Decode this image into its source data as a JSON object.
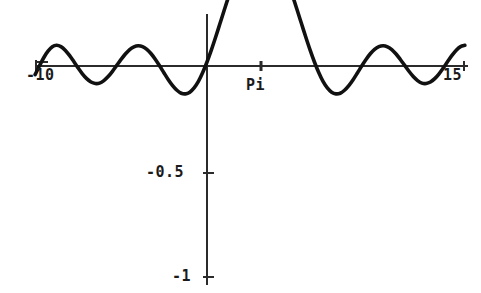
{
  "figure": {
    "width": 481,
    "height": 293,
    "background_color": "#ffffff",
    "curve_color": "#111111",
    "axis_color": "#2b2b2b"
  },
  "labels": {
    "x_min": "-10",
    "x_max": "15",
    "x_pi": "Pi",
    "y_half": "-0.5",
    "y_one": "-1"
  },
  "chart_data": {
    "type": "line",
    "title": "",
    "xlabel": "",
    "ylabel": "",
    "xlim": [
      -10,
      15
    ],
    "ylim": [
      -1,
      0.3
    ],
    "grid": false,
    "legend": null,
    "axes": {
      "x_axis_y_value": 0,
      "y_axis_x_value": 0,
      "x_ticks": [
        -10,
        3.14159,
        15
      ],
      "x_tick_labels": [
        "-10",
        "Pi",
        "15"
      ],
      "y_ticks": [
        -0.5,
        -1
      ],
      "y_tick_labels": [
        "-0.5",
        "-1"
      ]
    },
    "annotations": [
      {
        "text": "Pi",
        "x": 3.14159,
        "y": 0,
        "note": "marked tick at x = Pi where the curve attains its minimum"
      }
    ],
    "series": [
      {
        "name": "sin(x)/(x - Pi)",
        "description": "damped oscillation, negative sinc centred at x = Pi, minimum value -1 at x = Pi",
        "x": [
          -10.0,
          -9.75,
          -9.5,
          -9.25,
          -9.0,
          -8.75,
          -8.5,
          -8.25,
          -8.0,
          -7.75,
          -7.5,
          -7.25,
          -7.0,
          -6.75,
          -6.5,
          -6.25,
          -6.0,
          -5.75,
          -5.5,
          -5.25,
          -5.0,
          -4.75,
          -4.5,
          -4.25,
          -4.0,
          -3.75,
          -3.5,
          -3.25,
          -3.0,
          -2.75,
          -2.5,
          -2.25,
          -2.0,
          -1.75,
          -1.5,
          -1.25,
          -1.0,
          -0.75,
          -0.5,
          -0.25,
          0.0,
          0.25,
          0.5,
          0.75,
          1.0,
          1.25,
          1.5,
          1.75,
          2.0,
          2.25,
          2.5,
          2.75,
          3.0,
          3.14159,
          3.25,
          3.5,
          3.75,
          4.0,
          4.25,
          4.5,
          4.75,
          5.0,
          5.25,
          5.5,
          5.75,
          6.0,
          6.25,
          6.5,
          6.75,
          7.0,
          7.25,
          7.5,
          7.75,
          8.0,
          8.25,
          8.5,
          8.75,
          9.0,
          9.25,
          9.5,
          9.75,
          10.0,
          10.25,
          10.5,
          10.75,
          11.0,
          11.25,
          11.5,
          11.75,
          12.0,
          12.25,
          12.5,
          12.75,
          13.0,
          13.25,
          13.5,
          13.75,
          14.0,
          14.25,
          14.5,
          14.75,
          15.0
        ],
        "y": [
          0.041,
          0.0,
          -0.039,
          -0.07,
          -0.091,
          -0.098,
          -0.092,
          -0.075,
          -0.05,
          -0.021,
          0.009,
          0.037,
          0.06,
          0.076,
          0.083,
          0.081,
          0.069,
          0.05,
          0.025,
          -0.003,
          -0.031,
          -0.057,
          -0.078,
          -0.091,
          -0.096,
          -0.092,
          -0.079,
          -0.058,
          -0.031,
          0.0,
          0.033,
          0.065,
          0.093,
          0.115,
          0.129,
          0.132,
          0.124,
          0.104,
          0.073,
          0.031,
          -0.019,
          -0.075,
          -0.136,
          -0.2,
          -0.264,
          -0.327,
          -0.385,
          -0.437,
          -0.48,
          -0.512,
          -0.532,
          -0.537,
          -0.527,
          -0.5,
          -0.527,
          -0.537,
          -0.532,
          -0.512,
          -0.48,
          -0.437,
          -0.385,
          -0.327,
          -0.264,
          -0.2,
          -0.136,
          -0.075,
          -0.019,
          0.031,
          0.073,
          0.104,
          0.124,
          0.132,
          0.129,
          0.115,
          0.093,
          0.065,
          0.033,
          0.0,
          -0.031,
          -0.058,
          -0.079,
          -0.092,
          -0.096,
          -0.091,
          -0.078,
          -0.057,
          -0.031,
          -0.003,
          0.025,
          0.05,
          0.069,
          0.081,
          0.083,
          0.076,
          0.06,
          0.037,
          0.009,
          -0.021,
          -0.05,
          -0.075,
          -0.092,
          -0.098
        ]
      }
    ]
  }
}
